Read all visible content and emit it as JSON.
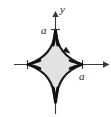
{
  "figure": {
    "width": 111,
    "height": 117,
    "background_color": "#ffffff"
  },
  "colors": {
    "axis": "#3a3a3a",
    "curve_stroke": "#1a1a1a",
    "curve_fill": "#e2e2e2",
    "label_text": "#2b2b2b",
    "direction_arrow": "#1a1a1a"
  },
  "axes": {
    "origin": {
      "x": 55,
      "y": 64
    },
    "x_axis": {
      "label": "",
      "start": {
        "x": 14,
        "y": 64
      },
      "end": {
        "x": 108,
        "y": 64
      },
      "arrowhead": "right"
    },
    "y_axis": {
      "label": "y",
      "start": {
        "x": 55,
        "y": 114
      },
      "end": {
        "x": 55,
        "y": 13
      },
      "arrowhead": "up"
    }
  },
  "ticks": [
    {
      "name": "tick-y-positive-a",
      "x": 55,
      "y": 29,
      "orientation": "horizontal",
      "length": 9
    },
    {
      "name": "tick-x-positive-a",
      "x": 82,
      "y": 64,
      "orientation": "vertical",
      "length": 9
    },
    {
      "name": "tick-x-negative-a",
      "x": 28,
      "y": 64,
      "orientation": "vertical",
      "length": 9
    }
  ],
  "labels": {
    "y_axis_label": "y",
    "y_axis_label_pos": {
      "x": 60,
      "y": 11
    },
    "a_vertical": "a",
    "a_vertical_pos": {
      "x": 42,
      "y": 33
    },
    "a_horizontal": "a",
    "a_horizontal_pos": {
      "x": 80,
      "y": 78
    }
  },
  "curve": {
    "name": "astroid",
    "equation": "x^(2/3) + y^(2/3) = a^(2/3)",
    "parameter_a": "a",
    "semi_axis_px": 27,
    "cusps": [
      {
        "name": "top",
        "x": 55,
        "y": 29
      },
      {
        "name": "right",
        "x": 82,
        "y": 64
      },
      {
        "name": "bottom",
        "x": 55,
        "y": 100
      },
      {
        "name": "left",
        "x": 28,
        "y": 64
      }
    ],
    "fill": "#e2e2e2",
    "stroke": "#1a1a1a",
    "orientation": "counterclockwise",
    "direction_marker": {
      "name": "direction-arrow",
      "x": 68,
      "y": 51,
      "angle_deg": 215,
      "points": "up-left"
    }
  }
}
